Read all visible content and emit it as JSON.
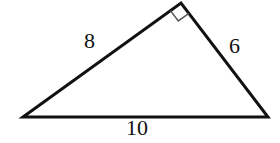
{
  "figure": {
    "kind": "geometry-diagram",
    "shape": "right-triangle",
    "background_color": "#ffffff",
    "stroke_color": "#111111",
    "stroke_width": 3,
    "vertices": {
      "left": {
        "x": 23,
        "y": 117
      },
      "apex": {
        "x": 181,
        "y": 3
      },
      "right": {
        "x": 268,
        "y": 117
      }
    },
    "right_angle": {
      "at_vertex": "apex",
      "marker": "right-angle-square",
      "size": 13,
      "stroke_color": "#555555",
      "stroke_width": 1.5
    },
    "labels": {
      "side_a": "8",
      "side_b": "6",
      "side_c": "10"
    }
  }
}
